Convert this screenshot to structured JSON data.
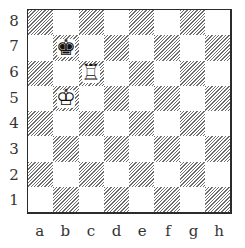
{
  "diagram": {
    "type": "chess-position",
    "orientation": "white-bottom",
    "ranks": [
      "8",
      "7",
      "6",
      "5",
      "4",
      "3",
      "2",
      "1"
    ],
    "files": [
      "a",
      "b",
      "c",
      "d",
      "e",
      "f",
      "g",
      "h"
    ],
    "colors": {
      "light_square": "#ffffff",
      "dark_square_hatch": "#6e6e6e",
      "border": "#2b2b2b",
      "label": "#333333"
    },
    "pieces": [
      {
        "square": "b7",
        "color": "black",
        "type": "king",
        "glyph": "♚"
      },
      {
        "square": "c6",
        "color": "white",
        "type": "rook",
        "glyph": "♖"
      },
      {
        "square": "b5",
        "color": "white",
        "type": "king",
        "glyph": "♔"
      }
    ]
  }
}
